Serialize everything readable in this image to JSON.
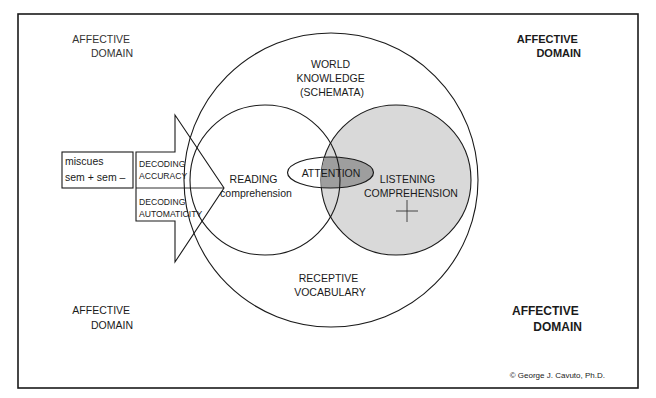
{
  "diagram": {
    "frame": {
      "border_color": "#1a1a1a"
    },
    "colors": {
      "line": "#1a1a1a",
      "listening_fill": "#d9d9d9",
      "attention_overlap_fill": "#9e9e9e",
      "background": "#ffffff"
    },
    "corner_labels": {
      "top_left": {
        "line1": "AFFECTIVE",
        "line2": "DOMAIN"
      },
      "top_right": {
        "line1": "AFFECTIVE",
        "line2": "DOMAIN"
      },
      "bottom_left": {
        "line1": "AFFECTIVE",
        "line2": "DOMAIN"
      },
      "bottom_right": {
        "line1": "AFFECTIVE",
        "line2": "DOMAIN"
      }
    },
    "outer_circle": {
      "top_label": {
        "line1": "WORLD",
        "line2": "KNOWLEDGE",
        "line3": "(SCHEMATA)"
      },
      "bottom_label": {
        "line1": "RECEPTIVE",
        "line2": "VOCABULARY"
      }
    },
    "reading_circle": {
      "line1": "READING",
      "line2": "comprehension"
    },
    "listening_circle": {
      "line1": "LISTENING",
      "line2": "COMPREHENSION",
      "marker": "+"
    },
    "attention_ellipse": {
      "label": "ATTENTION"
    },
    "miscues_box": {
      "line1": "miscues",
      "line2": "sem + sem –"
    },
    "arrow": {
      "upper": {
        "line1": "DECODING",
        "line2": "ACCURACY"
      },
      "lower": {
        "line1": "DECODING",
        "line2": "AUTOMATICITY"
      }
    },
    "copyright": "© George J. Cavuto, Ph.D."
  }
}
